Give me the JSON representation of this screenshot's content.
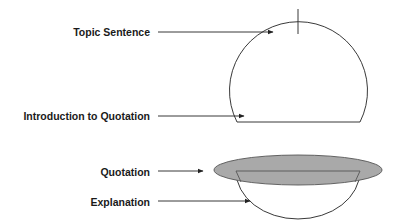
{
  "diagram": {
    "labels": {
      "topic_sentence": "Topic Sentence",
      "introduction_to_quotation": "Introduction to Quotation",
      "quotation": "Quotation",
      "explanation": "Explanation"
    },
    "colors": {
      "stroke": "#222222",
      "quotation_fill": "#a9a9a9",
      "background": "#ffffff",
      "text": "#1a1a1a"
    }
  }
}
